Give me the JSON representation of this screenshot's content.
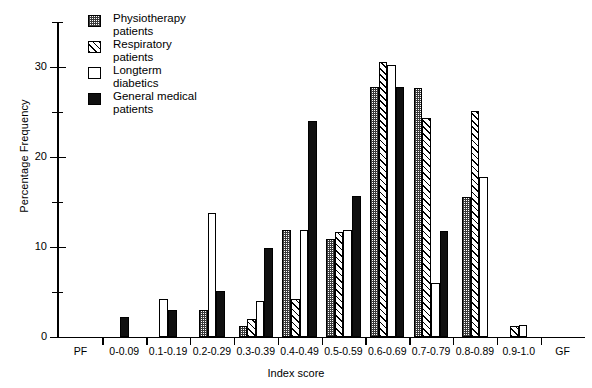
{
  "chart_data": {
    "type": "bar",
    "title": "",
    "xlabel": "Index score",
    "ylabel": "Percentage Frequency",
    "ylim": [
      0,
      35
    ],
    "yticks": [
      0,
      10,
      20,
      30
    ],
    "yticks_minor": [
      5,
      15,
      25,
      35
    ],
    "grid": false,
    "legend_position": "top-left",
    "categories": [
      "PF",
      "0-0.09",
      "0.1-0.19",
      "0.2-0.29",
      "0.3-0.39",
      "0.4-0.49",
      "0.5-0.59",
      "0.6-0.69",
      "0.7-0.79",
      "0.8-0.89",
      "0.9-1.0",
      "GF"
    ],
    "series": [
      {
        "name": "Physiotherapy patients",
        "pattern": "checkered-gray",
        "values": [
          0,
          0,
          0,
          3.0,
          1.2,
          11.8,
          10.9,
          27.8,
          27.7,
          15.5,
          0,
          0
        ]
      },
      {
        "name": "Respiratory patients",
        "pattern": "diagonal-hatch",
        "values": [
          0,
          0,
          0,
          0,
          2.0,
          4.2,
          11.6,
          30.5,
          24.3,
          25.1,
          1.2,
          0
        ]
      },
      {
        "name": "Longterm diabetics",
        "pattern": "white-open",
        "values": [
          0,
          0,
          4.2,
          13.7,
          4.0,
          11.8,
          11.8,
          30.2,
          6.0,
          17.8,
          1.3,
          0
        ]
      },
      {
        "name": "General medical patients",
        "pattern": "solid-black",
        "values": [
          0,
          2.2,
          3.0,
          5.1,
          9.9,
          24.0,
          15.6,
          27.8,
          11.7,
          0,
          0,
          0
        ]
      }
    ]
  },
  "legend": {
    "items": [
      {
        "label": "Physiotherapy\npatients",
        "pattern": "checkered-gray"
      },
      {
        "label": "Respiratory\npatients",
        "pattern": "diagonal-hatch"
      },
      {
        "label": "Longterm\ndiabetics",
        "pattern": "white-open"
      },
      {
        "label": "General medical\npatients",
        "pattern": "solid-black"
      }
    ]
  },
  "axes": {
    "y_title": "Percentage Frequency",
    "x_title": "Index score",
    "y_tick_labels": [
      "30",
      "20",
      "10",
      "0"
    ]
  },
  "colors": {
    "ink": "#000000",
    "background": "#ffffff",
    "pattern_gray": "#3a3a3a"
  }
}
